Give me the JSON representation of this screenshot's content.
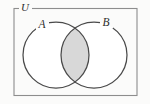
{
  "figure": {
    "kind": "venn-diagram",
    "background_color": "#fbfbfa",
    "stroke_color": "#4a4a4a",
    "shade_color": "#d8d8d8",
    "shade_stroke_color": "#6a6a6a",
    "circle_fill": "#ffffff"
  },
  "universe": {
    "label": "U",
    "label_x": 25,
    "label_y": 8.5,
    "rect": {
      "x": 14,
      "y": 8.5,
      "width": 123,
      "height": 87
    },
    "gap": {
      "start_x": 19,
      "end_x": 32
    }
  },
  "sets": [
    {
      "name": "set-a",
      "label": "A",
      "cx": 56,
      "cy": 55,
      "r": 33,
      "label_x": 42,
      "label_y": 25
    },
    {
      "name": "set-b",
      "label": "B",
      "cx": 94,
      "cy": 55,
      "r": 33,
      "label_x": 106,
      "label_y": 23.5
    }
  ],
  "region": {
    "name": "intersection",
    "label": "",
    "shaded": true,
    "notation": "A ∩ B"
  }
}
